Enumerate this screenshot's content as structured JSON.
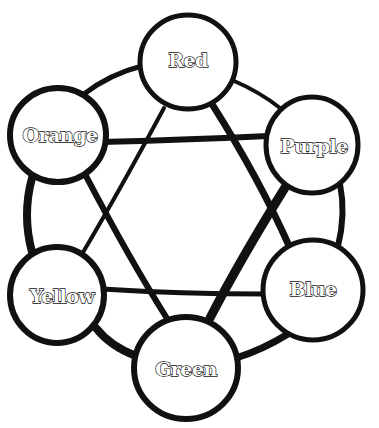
{
  "diagram": {
    "type": "color-wheel-relationship",
    "nodes": [
      {
        "id": "red",
        "label": "Red",
        "cx": 188,
        "cy": 62,
        "r": 48,
        "font_size": 19
      },
      {
        "id": "purple",
        "label": "Purple",
        "cx": 312,
        "cy": 145,
        "r": 47,
        "font_size": 19
      },
      {
        "id": "blue",
        "label": "Blue",
        "cx": 313,
        "cy": 290,
        "r": 50,
        "font_size": 19
      },
      {
        "id": "green",
        "label": "Green",
        "cx": 186,
        "cy": 368,
        "r": 52,
        "font_size": 19
      },
      {
        "id": "yellow",
        "label": "Yellow",
        "cx": 57,
        "cy": 295,
        "r": 48,
        "font_size": 19
      },
      {
        "id": "orange",
        "label": "Orange",
        "cx": 58,
        "cy": 135,
        "r": 48,
        "font_size": 19
      }
    ],
    "ring_edges": [
      {
        "from": "red",
        "to": "purple"
      },
      {
        "from": "purple",
        "to": "blue"
      },
      {
        "from": "blue",
        "to": "green"
      },
      {
        "from": "green",
        "to": "yellow"
      },
      {
        "from": "yellow",
        "to": "orange"
      },
      {
        "from": "orange",
        "to": "red"
      }
    ],
    "chords": [
      {
        "from": "orange",
        "to": "purple"
      },
      {
        "from": "red",
        "to": "yellow"
      },
      {
        "from": "red",
        "to": "blue"
      },
      {
        "from": "orange",
        "to": "green"
      },
      {
        "from": "purple",
        "to": "green"
      },
      {
        "from": "yellow",
        "to": "blue"
      }
    ],
    "line_color": "#111111",
    "fill_color": "#ffffff"
  }
}
